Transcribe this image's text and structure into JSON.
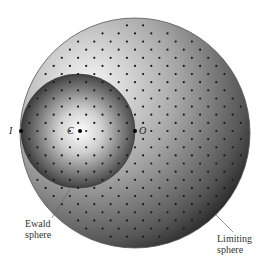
{
  "diagram": {
    "limiting_sphere": {
      "cx": 135,
      "cy": 133,
      "r": 115,
      "label_line1": "Limiting",
      "label_line2": "sphere"
    },
    "ewald_sphere": {
      "cx": 78,
      "cy": 131,
      "r": 57,
      "label_line1": "Ewald",
      "label_line2": "sphere"
    },
    "points": {
      "I": {
        "label": "I",
        "x": 21,
        "y": 131
      },
      "C": {
        "label": "C",
        "x": 80,
        "y": 131
      },
      "O": {
        "label": "O",
        "x": 135,
        "y": 131
      }
    },
    "lattice": {
      "spacing": 11.5,
      "origin_x": 135,
      "origin_y": 131,
      "angle_deg": 45,
      "dot_r": 1.1,
      "color": "#1a1a1a"
    },
    "colors": {
      "outline": "#555555",
      "leader": "#666666",
      "sphere_light": "#f4f4f4",
      "sphere_dark": "#111111"
    }
  }
}
